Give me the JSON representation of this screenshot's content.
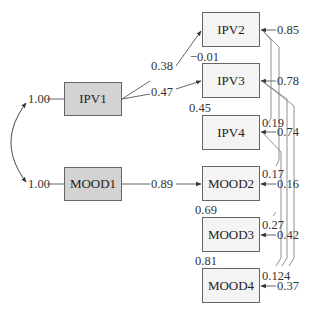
{
  "diagram": {
    "type": "path-diagram",
    "exogenous": [
      {
        "id": "IPV1",
        "label": "IPV1",
        "variance": "1.00"
      },
      {
        "id": "MOOD1",
        "label": "MOOD1",
        "variance": "1.00"
      }
    ],
    "endogenous": [
      {
        "id": "IPV2",
        "label": "IPV2",
        "error": "0.85"
      },
      {
        "id": "IPV3",
        "label": "IPV3",
        "error": "0.78"
      },
      {
        "id": "IPV4",
        "label": "IPV4",
        "error": "0.74"
      },
      {
        "id": "MOOD2",
        "label": "MOOD2",
        "error": "0.16"
      },
      {
        "id": "MOOD3",
        "label": "MOOD3",
        "error": "0.42"
      },
      {
        "id": "MOOD4",
        "label": "MOOD4",
        "error": "0.37"
      }
    ],
    "paths": [
      {
        "from": "IPV1",
        "to": "IPV2",
        "coef": "0.38"
      },
      {
        "from": "IPV1",
        "to": "IPV3",
        "coef": "0.47"
      },
      {
        "from": "MOOD1",
        "to": "MOOD2",
        "coef": "0.89"
      }
    ],
    "between_labels": {
      "ipv2_ipv3": "−0.01",
      "ipv3_ipv4": "0.45",
      "mood2_mood3": "0.69",
      "mood3_mood4": "0.81"
    },
    "error_covariances": {
      "ipv4_right": "0.19",
      "mood2_right": "0.17",
      "mood3_right": "0.27",
      "mood4_right": "0.124"
    }
  }
}
